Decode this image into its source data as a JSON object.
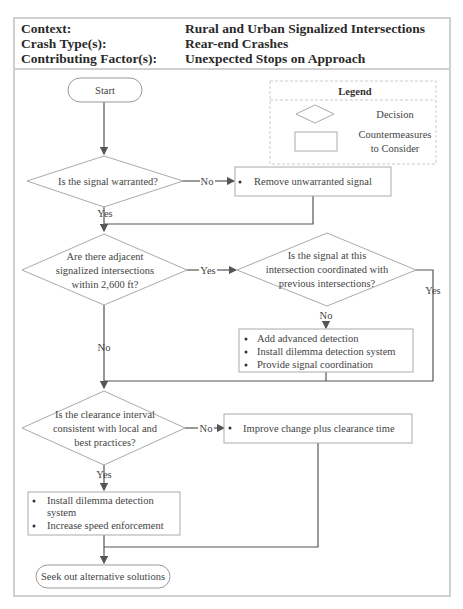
{
  "header": {
    "rows": [
      {
        "label": "Context:",
        "value": "Rural and Urban Signalized Intersections"
      },
      {
        "label": "Crash Type(s):",
        "value": "Rear-end Crashes"
      },
      {
        "label": "Contributing Factor(s):",
        "value": "Unexpected Stops on Approach"
      }
    ]
  },
  "legend": {
    "title": "Legend",
    "decision": "Decision",
    "countermeasures_line1": "Countermeasures",
    "countermeasures_line2": "to Consider"
  },
  "flow": {
    "start": "Start",
    "end": "Seek out alternative solutions",
    "decision1": {
      "text": "Is the signal warranted?",
      "no": "No",
      "yes": "Yes"
    },
    "action1": {
      "items": [
        "Remove unwarranted signal"
      ]
    },
    "decision2": {
      "lines": [
        "Are there adjacent",
        "signalized intersections",
        "within 2,600 ft?"
      ],
      "yes": "Yes",
      "no": "No"
    },
    "decision3": {
      "lines": [
        "Is the signal at this",
        "intersection coordinated with",
        "previous intersections?"
      ],
      "yes": "Yes",
      "no": "No"
    },
    "action2": {
      "items": [
        "Add advanced detection",
        "Install dilemma detection system",
        "Provide signal coordination"
      ]
    },
    "decision4": {
      "lines": [
        "Is the clearance interval",
        "consistent with local and",
        "best practices?"
      ],
      "no": "No",
      "yes": "Yes"
    },
    "action3": {
      "items": [
        "Improve change plus clearance time"
      ]
    },
    "action4": {
      "items_lines": [
        "Install dilemma detection",
        "system",
        "Increase speed enforcement"
      ]
    }
  }
}
